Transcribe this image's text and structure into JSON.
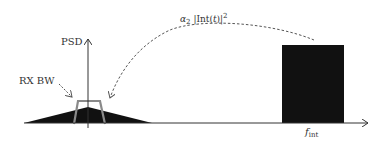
{
  "diagram": {
    "y_axis_label": "PSD",
    "rx_bw_label": "RX BW",
    "interferer_label": {
      "alpha": "α",
      "alpha_sub": "2",
      "body": "|Int(",
      "t": "t",
      "close": ")|",
      "sup": "2"
    },
    "freq_label": {
      "f": "f",
      "sub": "int"
    },
    "colors": {
      "signal_fill": "#111111",
      "interferer_fill": "#111111",
      "filter_outline": "#8a8a8a",
      "axis": "#333333",
      "dashed_arrow": "#555555"
    }
  }
}
